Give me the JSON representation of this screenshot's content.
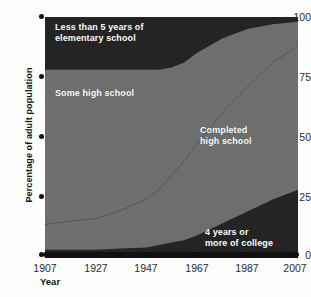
{
  "chart_data": {
    "type": "area",
    "title": "",
    "subtitle": "",
    "xlabel": "Year",
    "ylabel": "Percentage of adult population",
    "xlim": [
      1907,
      2007
    ],
    "ylim": [
      0,
      100
    ],
    "xticks": [
      1907,
      1927,
      1947,
      1967,
      1987,
      2007
    ],
    "yticks": [
      0,
      25,
      50,
      75,
      100
    ],
    "grid": false,
    "legend_position": "inline-annotations",
    "stacked": true,
    "x": [
      1907,
      1917,
      1927,
      1937,
      1947,
      1952,
      1957,
      1962,
      1967,
      1977,
      1987,
      1997,
      2007
    ],
    "series": [
      {
        "name": "4 years or more of college",
        "color": "#242424",
        "values": [
          3,
          3,
          3,
          3.5,
          4,
          5,
          6,
          7,
          9,
          14,
          19,
          24,
          28
        ]
      },
      {
        "name": "Completed high school",
        "color": "#6e6e6e",
        "values": [
          10.5,
          12,
          13,
          16,
          20,
          23,
          28,
          33,
          38,
          46,
          52,
          57,
          60
        ]
      },
      {
        "name": "Some high school",
        "color": "#6e6e6e",
        "values": [
          64.5,
          63,
          62,
          58,
          54,
          50,
          45,
          41,
          38,
          31,
          24,
          16,
          10
        ]
      },
      {
        "name": "Less than 5 years of elementary school",
        "color": "#242424",
        "values": [
          22,
          22,
          22,
          22.5,
          22,
          22,
          21,
          19,
          15,
          9,
          5,
          3,
          2
        ]
      }
    ],
    "boundaries": {
      "college_top": [
        3,
        3,
        3,
        3.5,
        4,
        5,
        6,
        7,
        9,
        14,
        19,
        24,
        28
      ],
      "completed_hs_top": [
        13.5,
        15,
        16,
        19.5,
        24,
        28,
        34,
        40,
        47,
        60,
        71,
        81,
        88
      ],
      "some_hs_top": [
        78,
        78,
        78,
        78,
        78,
        78,
        79,
        81,
        85,
        91,
        95,
        97,
        98
      ]
    },
    "annotations": [
      {
        "id": "label-elementary",
        "text": "Less than 5 years of\nelementary school"
      },
      {
        "id": "label-some-hs",
        "text": "Some high school"
      },
      {
        "id": "label-completed-hs",
        "text": "Completed\nhigh school"
      },
      {
        "id": "label-college",
        "text": "4 years or\nmore of college"
      }
    ],
    "colors": {
      "dark_band": "#242424",
      "gray_band": "#6e6e6e",
      "axis": "#111111",
      "label_text": "#ffffff",
      "tick_text": "#2b2b2b",
      "background": "#fdfdfd"
    }
  }
}
